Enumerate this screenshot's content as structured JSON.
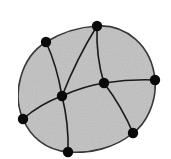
{
  "diagram": {
    "type": "planar-graph",
    "region_fill": "#c8c8c8",
    "stroke_color": "#333333",
    "node_color": "#0a0a0a",
    "nodes": [
      {
        "id": "top",
        "x": 97,
        "y": 26
      },
      {
        "id": "upper-left",
        "x": 46,
        "y": 42
      },
      {
        "id": "right",
        "x": 155,
        "y": 80
      },
      {
        "id": "center-right",
        "x": 104,
        "y": 83
      },
      {
        "id": "center",
        "x": 62,
        "y": 96
      },
      {
        "id": "left",
        "x": 23,
        "y": 119
      },
      {
        "id": "lower-right",
        "x": 133,
        "y": 133
      },
      {
        "id": "bottom",
        "x": 68,
        "y": 152
      }
    ],
    "outer_boundary": [
      "top",
      "right",
      "lower-right",
      "bottom",
      "left",
      "upper-left"
    ],
    "inner_edges": [
      [
        "upper-left",
        "center"
      ],
      [
        "top",
        "center"
      ],
      [
        "top",
        "center-right"
      ],
      [
        "center",
        "center-right"
      ],
      [
        "center-right",
        "right"
      ],
      [
        "center-right",
        "lower-right"
      ],
      [
        "center",
        "left"
      ],
      [
        "center",
        "bottom"
      ]
    ]
  }
}
